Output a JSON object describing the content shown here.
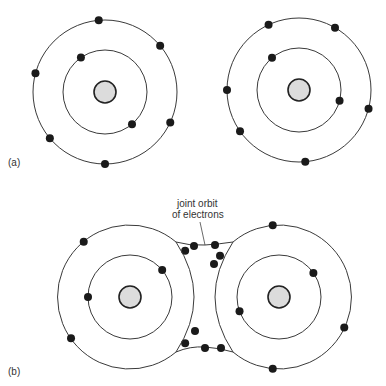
{
  "figure": {
    "panel_a_label": "(a)",
    "panel_b_label": "(b)",
    "annotation_line1": "joint orbit",
    "annotation_line2": "of electrons"
  },
  "atoms": {
    "a_left": {
      "inner_electrons": 2,
      "outer_electrons": 6,
      "inner_angles": [
        -125,
        50
      ],
      "outer_angles": [
        -95,
        -40,
        25,
        90,
        140,
        195
      ]
    },
    "a_right": {
      "inner_electrons": 2,
      "outer_electrons": 6,
      "inner_angles": [
        -130,
        15
      ],
      "outer_angles": [
        -115,
        -60,
        15,
        85,
        145,
        180
      ]
    },
    "b_left": {
      "inner_electrons": 2,
      "outer_electrons": 4,
      "inner_angles": [
        -40,
        180
      ],
      "outer_angles": [
        -130,
        -40,
        40,
        145
      ]
    },
    "b_right": {
      "inner_electrons": 2,
      "outer_electrons": 4,
      "inner_angles": [
        -35,
        160
      ],
      "outer_angles": [
        -95,
        25,
        95,
        215
      ]
    }
  },
  "shared_electrons": {
    "top_count": 2,
    "bottom_count": 2
  }
}
